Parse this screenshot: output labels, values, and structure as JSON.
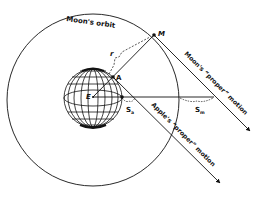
{
  "diagram": {
    "labels": {
      "orbit": "Moon's orbit",
      "moon_point": "M",
      "apple_point": "A",
      "earth_point": "E",
      "radius": "r",
      "apple_fall": "S",
      "apple_fall_sub": "a",
      "moon_fall": "S",
      "moon_fall_sub": "m",
      "moon_motion": "Moon's “proper” motion",
      "apple_motion": "Apple's “proper” motion"
    },
    "colors": {
      "ink": "#111111",
      "background": "#ffffff"
    }
  }
}
